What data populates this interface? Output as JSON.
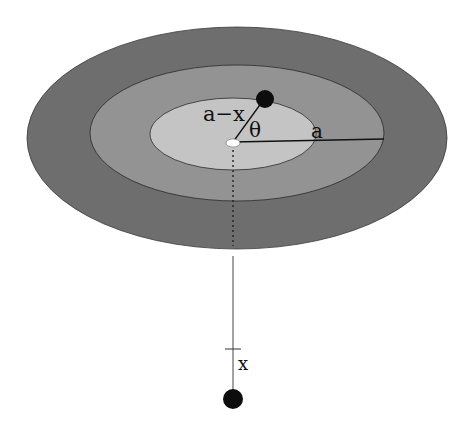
{
  "diagram": {
    "colors": {
      "background": "#ffffff",
      "outer_ring": "#6e6e6e",
      "middle_ring": "#939393",
      "inner_disk": "#c4c4c4",
      "center_marker": "#ffffff",
      "mass": "#0d0d0d",
      "line": "#111111"
    },
    "labels": {
      "distance_a_minus_x": "a−x",
      "angle": "θ",
      "radius": "a",
      "offset": "x"
    }
  }
}
